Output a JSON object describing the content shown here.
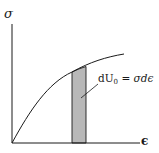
{
  "diagram": {
    "title": "",
    "axes": {
      "y_label": "σ",
      "x_label": "ϵ"
    },
    "curve": "stress-strain curve (concave down)",
    "strip": {
      "fill": "#b8b8b8",
      "annotation": {
        "prefix": "dU",
        "subscript": "0",
        "equals": " = ",
        "rhs": "σdϵ"
      }
    },
    "colors": {
      "line": "#1a1a1a",
      "strip_fill": "#b8b8b8",
      "background": "#ffffff"
    }
  }
}
